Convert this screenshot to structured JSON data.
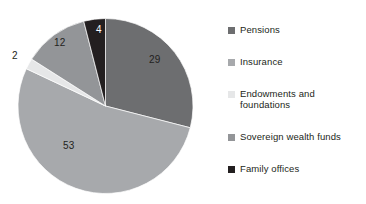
{
  "chart_data": {
    "type": "pie",
    "title": "",
    "subtitle": "",
    "xlabel": "",
    "ylabel": "",
    "grid": false,
    "legend_position": "right",
    "categories": [
      "Pensions",
      "Insurance",
      "Endowments and foundations",
      "Sovereign wealth funds",
      "Family offices"
    ],
    "values": [
      29,
      53,
      2,
      12,
      4
    ],
    "value_labels": [
      "29",
      "53",
      "2",
      "12",
      "4"
    ],
    "colors": [
      "#6d6e70",
      "#a7a9ac",
      "#e6e7e8",
      "#939598",
      "#231f20"
    ],
    "start_angle_deg": 0,
    "direction": "clockwise",
    "slices": [
      {
        "label": "Pensions",
        "value": 29,
        "value_text": "29",
        "color": "#6d6e70"
      },
      {
        "label": "Insurance",
        "value": 53,
        "value_text": "53",
        "color": "#a7a9ac"
      },
      {
        "label": "Endowments and foundations",
        "value": 2,
        "value_text": "2",
        "color": "#e6e7e8"
      },
      {
        "label": "Sovereign wealth funds",
        "value": 12,
        "value_text": "12",
        "color": "#939598"
      },
      {
        "label": "Family offices",
        "value": 4,
        "value_text": "4",
        "color": "#231f20"
      }
    ]
  },
  "legend": {
    "items": [
      {
        "label": "Pensions",
        "line1": "Pensions",
        "line2": "",
        "color": "#6d6e70"
      },
      {
        "label": "Insurance",
        "line1": "Insurance",
        "line2": "",
        "color": "#a7a9ac"
      },
      {
        "label": "Endowments and foundations",
        "line1": "Endowments and",
        "line2": "foundations",
        "color": "#e6e7e8"
      },
      {
        "label": "Sovereign wealth funds",
        "line1": "Sovereign wealth funds",
        "line2": "",
        "color": "#939598"
      },
      {
        "label": "Family offices",
        "line1": "Family offices",
        "line2": "",
        "color": "#231f20"
      }
    ]
  },
  "data_labels": [
    {
      "text": "29",
      "left": 149,
      "top": 55
    },
    {
      "text": "53",
      "left": 63,
      "top": 141
    },
    {
      "text": "2",
      "left": 12,
      "top": 51
    },
    {
      "text": "12",
      "left": 54,
      "top": 38
    },
    {
      "text": "4",
      "left": 96,
      "top": 25
    }
  ]
}
